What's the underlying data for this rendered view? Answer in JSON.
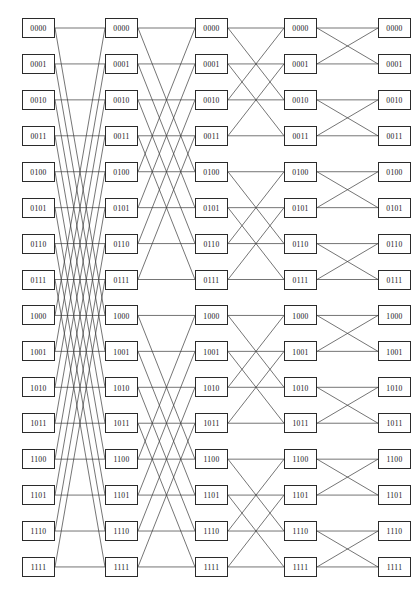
{
  "diagram": {
    "type": "butterfly-network",
    "stage_count": 5,
    "nodes_per_stage": 16,
    "label_bits": 4,
    "node_labels": [
      "0000",
      "0001",
      "0010",
      "0011",
      "0100",
      "0101",
      "0110",
      "0111",
      "1000",
      "1001",
      "1010",
      "1011",
      "1100",
      "1101",
      "1110",
      "1111"
    ],
    "stage_strides": [
      8,
      4,
      2,
      1
    ],
    "geometry": {
      "canvas_width": 416,
      "canvas_height": 602,
      "box_width": 33,
      "box_height": 20,
      "column_x": [
        22,
        105,
        195,
        284,
        378
      ],
      "row_y_first": 18,
      "row_spacing": 35.93,
      "font_size": 7.6
    },
    "colors": {
      "background": "#ffffff",
      "box_border": "#2b2b2b",
      "box_fill": "#ffffff",
      "edge_stroke": "#3a3a3a",
      "label_text": "#111111"
    },
    "edge_style": {
      "stroke_width": 0.7,
      "straight": true
    }
  }
}
